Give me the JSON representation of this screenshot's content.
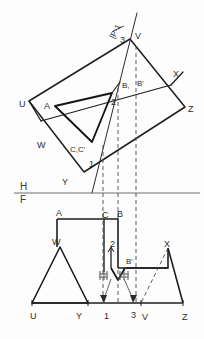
{
  "drawing": {
    "title": "Orthographic two-view projection of a truncated prism with an oblique cutting plane",
    "sheet": {
      "width_px": 204,
      "height_px": 339,
      "background": "#fdfdfd"
    },
    "colors": {
      "object_line": "#1e1e1e",
      "thin_line": "#3b3b3b",
      "hidden_line": "#4a4a4a",
      "reference_line": "#6e6e6e",
      "text": "#2b2b2b",
      "smudge": "#555555"
    },
    "reference_line": {
      "upper_label": "H",
      "lower_label": "F",
      "y_px": 193
    },
    "plane_annotation": {
      "text": "[P-1",
      "rotation_deg": -64
    },
    "top_view": {
      "name": "H-projection (top view)",
      "labels": [
        {
          "text": "3",
          "x": 120,
          "y": 36
        },
        {
          "text": "V",
          "x": 135,
          "y": 32
        },
        {
          "text": "X",
          "x": 173,
          "y": 70
        },
        {
          "text": "Z",
          "x": 188,
          "y": 105
        },
        {
          "text": "U",
          "x": 19,
          "y": 100
        },
        {
          "text": "A",
          "x": 44,
          "y": 102
        },
        {
          "text": "2",
          "x": 111,
          "y": 98
        },
        {
          "text": "B,",
          "x": 122,
          "y": 82
        },
        {
          "text": "B'",
          "x": 137,
          "y": 80
        },
        {
          "text": "W",
          "x": 37,
          "y": 141
        },
        {
          "text": "C,C'",
          "x": 70,
          "y": 146
        },
        {
          "text": "1",
          "x": 89,
          "y": 160
        },
        {
          "text": "Y",
          "x": 62,
          "y": 178
        }
      ]
    },
    "front_view": {
      "name": "F-projection (front view)",
      "labels": [
        {
          "text": "A",
          "x": 56,
          "y": 209
        },
        {
          "text": "C",
          "x": 102,
          "y": 211
        },
        {
          "text": "B",
          "x": 117,
          "y": 210
        },
        {
          "text": "W",
          "x": 52,
          "y": 238
        },
        {
          "text": "2",
          "x": 110,
          "y": 240
        },
        {
          "text": "B'",
          "x": 126,
          "y": 258
        },
        {
          "text": "X",
          "x": 164,
          "y": 240
        },
        {
          "text": "U",
          "x": 30,
          "y": 312
        },
        {
          "text": "Y",
          "x": 76,
          "y": 312
        },
        {
          "text": "1",
          "x": 104,
          "y": 312
        },
        {
          "text": "3",
          "x": 131,
          "y": 311
        },
        {
          "text": "V",
          "x": 142,
          "y": 313
        },
        {
          "text": "Z",
          "x": 182,
          "y": 313
        }
      ]
    },
    "projector_lines": {
      "style": "dashed vertical",
      "count": 3,
      "x_positions_px": [
        103,
        118,
        136
      ]
    },
    "erasure_marks": {
      "count": 2,
      "note": "two small scribbled / erased smudges near points 1 and 3 in the front view"
    }
  }
}
